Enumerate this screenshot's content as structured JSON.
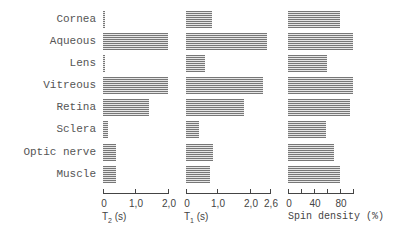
{
  "chart_data": {
    "type": "bar",
    "orientation": "horizontal",
    "title": "",
    "categories": [
      "Cornea",
      "Aqueous",
      "Lens",
      "Vitreous",
      "Retina",
      "Sclera",
      "Optic nerve",
      "Muscle"
    ],
    "panels": [
      {
        "name": "T2",
        "xlabel": "T2 (s)",
        "xlim": [
          0,
          2.0
        ],
        "ticks": [
          0,
          1.0,
          2.0
        ],
        "tick_labels": [
          "0",
          "1,0",
          "2,0"
        ],
        "values": [
          0.05,
          2.0,
          0.05,
          2.0,
          1.4,
          0.15,
          0.4,
          0.4
        ]
      },
      {
        "name": "T1",
        "xlabel": "T1 (s)",
        "xlim": [
          0,
          2.6
        ],
        "ticks": [
          0,
          1.0,
          2.0,
          2.6
        ],
        "tick_labels": [
          "0",
          "1,0",
          "2,0",
          "2,6"
        ],
        "values": [
          0.8,
          2.5,
          0.6,
          2.4,
          1.8,
          0.4,
          0.85,
          0.75
        ]
      },
      {
        "name": "Spin density",
        "xlabel": "Spin density (%)",
        "xlim": [
          0,
          100
        ],
        "ticks": [
          0,
          20,
          40,
          60,
          80,
          100
        ],
        "tick_labels": [
          "0",
          "",
          "40",
          "",
          "80",
          ""
        ],
        "values": [
          80,
          100,
          60,
          100,
          95,
          58,
          70,
          80
        ]
      }
    ],
    "grid": false,
    "legend": null
  },
  "labels": [
    "Cornea",
    "Aqueous",
    "Lens",
    "Vitreous",
    "Retina",
    "Sclera",
    "Optic nerve",
    "Muscle"
  ],
  "axes": {
    "t2": {
      "title_main": "T",
      "title_sub": "2",
      "title_unit": " (s)",
      "ticks": [
        "0",
        "1,0",
        "2,0"
      ]
    },
    "t1": {
      "title_main": "T",
      "title_sub": "1",
      "title_unit": " (s)",
      "ticks": [
        "0",
        "1,0",
        "2,0",
        "2,6"
      ]
    },
    "sd": {
      "title": "Spin density (%)",
      "ticks": [
        "0",
        "40",
        "80"
      ]
    }
  }
}
